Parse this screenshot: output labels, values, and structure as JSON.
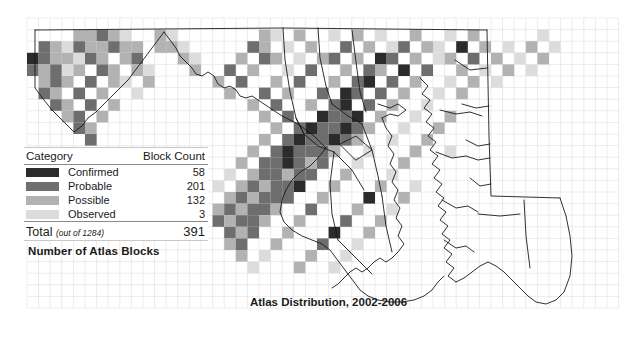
{
  "title": "Atlas Distribution, 2002-2006",
  "blocks_caption": "Number of Atlas Blocks",
  "legend": {
    "header": {
      "category": "Category",
      "count": "Block Count"
    },
    "rows": [
      {
        "label": "Confirmed",
        "count": "58",
        "color": "#2b2b2b"
      },
      {
        "label": "Probable",
        "count": "201",
        "color": "#6e6e6e"
      },
      {
        "label": "Possible",
        "count": "132",
        "color": "#b2b2b2"
      },
      {
        "label": "Observed",
        "count": "3",
        "color": "#dcdcdc"
      }
    ],
    "total": {
      "label": "Total",
      "note": "(out of 1284)",
      "count": "391"
    }
  },
  "map": {
    "grid_size": 11.6,
    "grid_origin_x": 27,
    "grid_origin_y": 18,
    "grid_line_color": "#d9d9d9",
    "outline_color": "#1a1a1a",
    "cells": [
      [
        4,
        1,
        "#b2b2b2"
      ],
      [
        5,
        1,
        "#b2b2b2"
      ],
      [
        6,
        1,
        "#6e6e6e"
      ],
      [
        7,
        1,
        "#b2b2b2"
      ],
      [
        8,
        1,
        "#dcdcdc"
      ],
      [
        11,
        1,
        "#b2b2b2"
      ],
      [
        12,
        1,
        "#dcdcdc"
      ],
      [
        20,
        1,
        "#b2b2b2"
      ],
      [
        21,
        1,
        "#dcdcdc"
      ],
      [
        23,
        1,
        "#b2b2b2"
      ],
      [
        26,
        1,
        "#dcdcdc"
      ],
      [
        28,
        1,
        "#b2b2b2"
      ],
      [
        30,
        1,
        "#dcdcdc"
      ],
      [
        33,
        1,
        "#b2b2b2"
      ],
      [
        36,
        1,
        "#dcdcdc"
      ],
      [
        38,
        1,
        "#b2b2b2"
      ],
      [
        44,
        1,
        "#dcdcdc"
      ],
      [
        1,
        2,
        "#6e6e6e"
      ],
      [
        2,
        2,
        "#b2b2b2"
      ],
      [
        3,
        2,
        "#dcdcdc"
      ],
      [
        4,
        2,
        "#6e6e6e"
      ],
      [
        5,
        2,
        "#b2b2b2"
      ],
      [
        6,
        2,
        "#b2b2b2"
      ],
      [
        7,
        2,
        "#6e6e6e"
      ],
      [
        8,
        2,
        "#b2b2b2"
      ],
      [
        9,
        2,
        "#b2b2b2"
      ],
      [
        11,
        2,
        "#b2b2b2"
      ],
      [
        12,
        2,
        "#b2b2b2"
      ],
      [
        13,
        2,
        "#dcdcdc"
      ],
      [
        19,
        2,
        "#6e6e6e"
      ],
      [
        20,
        2,
        "#b2b2b2"
      ],
      [
        22,
        2,
        "#dcdcdc"
      ],
      [
        24,
        2,
        "#b2b2b2"
      ],
      [
        27,
        2,
        "#6e6e6e"
      ],
      [
        29,
        2,
        "#b2b2b2"
      ],
      [
        31,
        2,
        "#dcdcdc"
      ],
      [
        32,
        2,
        "#6e6e6e"
      ],
      [
        34,
        2,
        "#b2b2b2"
      ],
      [
        35,
        2,
        "#dcdcdc"
      ],
      [
        37,
        2,
        "#2b2b2b"
      ],
      [
        39,
        2,
        "#b2b2b2"
      ],
      [
        41,
        2,
        "#dcdcdc"
      ],
      [
        43,
        2,
        "#b2b2b2"
      ],
      [
        45,
        2,
        "#dcdcdc"
      ],
      [
        0,
        3,
        "#2b2b2b"
      ],
      [
        1,
        3,
        "#6e6e6e"
      ],
      [
        2,
        3,
        "#b2b2b2"
      ],
      [
        3,
        3,
        "#b2b2b2"
      ],
      [
        4,
        3,
        "#dcdcdc"
      ],
      [
        5,
        3,
        "#6e6e6e"
      ],
      [
        6,
        3,
        "#b2b2b2"
      ],
      [
        8,
        3,
        "#b2b2b2"
      ],
      [
        9,
        3,
        "#6e6e6e"
      ],
      [
        13,
        3,
        "#b2b2b2"
      ],
      [
        14,
        3,
        "#dcdcdc"
      ],
      [
        18,
        3,
        "#b2b2b2"
      ],
      [
        20,
        3,
        "#6e6e6e"
      ],
      [
        21,
        3,
        "#b2b2b2"
      ],
      [
        23,
        3,
        "#dcdcdc"
      ],
      [
        25,
        3,
        "#b2b2b2"
      ],
      [
        26,
        3,
        "#6e6e6e"
      ],
      [
        28,
        3,
        "#b2b2b2"
      ],
      [
        30,
        3,
        "#2b2b2b"
      ],
      [
        31,
        3,
        "#6e6e6e"
      ],
      [
        33,
        3,
        "#b2b2b2"
      ],
      [
        35,
        3,
        "#dcdcdc"
      ],
      [
        36,
        3,
        "#b2b2b2"
      ],
      [
        38,
        3,
        "#6e6e6e"
      ],
      [
        40,
        3,
        "#b2b2b2"
      ],
      [
        42,
        3,
        "#dcdcdc"
      ],
      [
        44,
        3,
        "#b2b2b2"
      ],
      [
        0,
        4,
        "#6e6e6e"
      ],
      [
        1,
        4,
        "#b2b2b2"
      ],
      [
        2,
        4,
        "#6e6e6e"
      ],
      [
        3,
        4,
        "#dcdcdc"
      ],
      [
        4,
        4,
        "#b2b2b2"
      ],
      [
        6,
        4,
        "#6e6e6e"
      ],
      [
        7,
        4,
        "#b2b2b2"
      ],
      [
        9,
        4,
        "#b2b2b2"
      ],
      [
        10,
        4,
        "#dcdcdc"
      ],
      [
        14,
        4,
        "#b2b2b2"
      ],
      [
        17,
        4,
        "#6e6e6e"
      ],
      [
        19,
        4,
        "#b2b2b2"
      ],
      [
        22,
        4,
        "#dcdcdc"
      ],
      [
        24,
        4,
        "#6e6e6e"
      ],
      [
        27,
        4,
        "#b2b2b2"
      ],
      [
        29,
        4,
        "#6e6e6e"
      ],
      [
        30,
        4,
        "#b2b2b2"
      ],
      [
        32,
        4,
        "#2b2b2b"
      ],
      [
        34,
        4,
        "#6e6e6e"
      ],
      [
        37,
        4,
        "#b2b2b2"
      ],
      [
        39,
        4,
        "#dcdcdc"
      ],
      [
        41,
        4,
        "#b2b2b2"
      ],
      [
        43,
        4,
        "#dcdcdc"
      ],
      [
        1,
        5,
        "#b2b2b2"
      ],
      [
        2,
        5,
        "#6e6e6e"
      ],
      [
        3,
        5,
        "#b2b2b2"
      ],
      [
        5,
        5,
        "#6e6e6e"
      ],
      [
        7,
        5,
        "#b2b2b2"
      ],
      [
        8,
        5,
        "#dcdcdc"
      ],
      [
        10,
        5,
        "#b2b2b2"
      ],
      [
        16,
        5,
        "#b2b2b2"
      ],
      [
        18,
        5,
        "#6e6e6e"
      ],
      [
        21,
        5,
        "#b2b2b2"
      ],
      [
        23,
        5,
        "#6e6e6e"
      ],
      [
        26,
        5,
        "#b2b2b2"
      ],
      [
        28,
        5,
        "#6e6e6e"
      ],
      [
        29,
        5,
        "#2b2b2b"
      ],
      [
        31,
        5,
        "#6e6e6e"
      ],
      [
        33,
        5,
        "#b2b2b2"
      ],
      [
        36,
        5,
        "#dcdcdc"
      ],
      [
        38,
        5,
        "#b2b2b2"
      ],
      [
        40,
        5,
        "#dcdcdc"
      ],
      [
        1,
        6,
        "#6e6e6e"
      ],
      [
        2,
        6,
        "#b2b2b2"
      ],
      [
        4,
        6,
        "#6e6e6e"
      ],
      [
        6,
        6,
        "#b2b2b2"
      ],
      [
        9,
        6,
        "#dcdcdc"
      ],
      [
        17,
        6,
        "#b2b2b2"
      ],
      [
        20,
        6,
        "#6e6e6e"
      ],
      [
        22,
        6,
        "#b2b2b2"
      ],
      [
        25,
        6,
        "#6e6e6e"
      ],
      [
        27,
        6,
        "#2b2b2b"
      ],
      [
        28,
        6,
        "#6e6e6e"
      ],
      [
        30,
        6,
        "#6e6e6e"
      ],
      [
        32,
        6,
        "#b2b2b2"
      ],
      [
        35,
        6,
        "#dcdcdc"
      ],
      [
        37,
        6,
        "#b2b2b2"
      ],
      [
        2,
        7,
        "#6e6e6e"
      ],
      [
        3,
        7,
        "#b2b2b2"
      ],
      [
        5,
        7,
        "#6e6e6e"
      ],
      [
        7,
        7,
        "#b2b2b2"
      ],
      [
        19,
        7,
        "#b2b2b2"
      ],
      [
        21,
        7,
        "#6e6e6e"
      ],
      [
        24,
        7,
        "#b2b2b2"
      ],
      [
        26,
        7,
        "#6e6e6e"
      ],
      [
        27,
        7,
        "#2b2b2b"
      ],
      [
        29,
        7,
        "#6e6e6e"
      ],
      [
        31,
        7,
        "#b2b2b2"
      ],
      [
        34,
        7,
        "#dcdcdc"
      ],
      [
        3,
        8,
        "#b2b2b2"
      ],
      [
        4,
        8,
        "#6e6e6e"
      ],
      [
        6,
        8,
        "#b2b2b2"
      ],
      [
        20,
        8,
        "#b2b2b2"
      ],
      [
        22,
        8,
        "#6e6e6e"
      ],
      [
        25,
        8,
        "#2b2b2b"
      ],
      [
        26,
        8,
        "#6e6e6e"
      ],
      [
        27,
        8,
        "#6e6e6e"
      ],
      [
        28,
        8,
        "#2b2b2b"
      ],
      [
        30,
        8,
        "#b2b2b2"
      ],
      [
        33,
        8,
        "#dcdcdc"
      ],
      [
        36,
        8,
        "#b2b2b2"
      ],
      [
        4,
        9,
        "#6e6e6e"
      ],
      [
        5,
        9,
        "#b2b2b2"
      ],
      [
        21,
        9,
        "#b2b2b2"
      ],
      [
        23,
        9,
        "#6e6e6e"
      ],
      [
        24,
        9,
        "#2b2b2b"
      ],
      [
        25,
        9,
        "#6e6e6e"
      ],
      [
        26,
        9,
        "#6e6e6e"
      ],
      [
        27,
        9,
        "#2b2b2b"
      ],
      [
        28,
        9,
        "#6e6e6e"
      ],
      [
        29,
        9,
        "#b2b2b2"
      ],
      [
        32,
        9,
        "#dcdcdc"
      ],
      [
        35,
        9,
        "#b2b2b2"
      ],
      [
        5,
        10,
        "#6e6e6e"
      ],
      [
        20,
        10,
        "#b2b2b2"
      ],
      [
        22,
        10,
        "#6e6e6e"
      ],
      [
        23,
        10,
        "#2b2b2b"
      ],
      [
        24,
        10,
        "#6e6e6e"
      ],
      [
        25,
        10,
        "#6e6e6e"
      ],
      [
        26,
        10,
        "#2b2b2b"
      ],
      [
        27,
        10,
        "#6e6e6e"
      ],
      [
        28,
        10,
        "#b2b2b2"
      ],
      [
        31,
        10,
        "#dcdcdc"
      ],
      [
        34,
        10,
        "#b2b2b2"
      ],
      [
        19,
        11,
        "#b2b2b2"
      ],
      [
        21,
        11,
        "#6e6e6e"
      ],
      [
        22,
        11,
        "#2b2b2b"
      ],
      [
        23,
        11,
        "#6e6e6e"
      ],
      [
        24,
        11,
        "#6e6e6e"
      ],
      [
        25,
        11,
        "#6e6e6e"
      ],
      [
        26,
        11,
        "#b2b2b2"
      ],
      [
        29,
        11,
        "#dcdcdc"
      ],
      [
        33,
        11,
        "#b2b2b2"
      ],
      [
        36,
        11,
        "#dcdcdc"
      ],
      [
        18,
        12,
        "#b2b2b2"
      ],
      [
        20,
        12,
        "#6e6e6e"
      ],
      [
        21,
        12,
        "#6e6e6e"
      ],
      [
        22,
        12,
        "#2b2b2b"
      ],
      [
        23,
        12,
        "#6e6e6e"
      ],
      [
        24,
        12,
        "#b2b2b2"
      ],
      [
        25,
        12,
        "#6e6e6e"
      ],
      [
        28,
        12,
        "#dcdcdc"
      ],
      [
        32,
        12,
        "#b2b2b2"
      ],
      [
        17,
        13,
        "#dcdcdc"
      ],
      [
        19,
        13,
        "#b2b2b2"
      ],
      [
        20,
        13,
        "#6e6e6e"
      ],
      [
        21,
        13,
        "#6e6e6e"
      ],
      [
        22,
        13,
        "#b2b2b2"
      ],
      [
        23,
        13,
        "#6e6e6e"
      ],
      [
        24,
        13,
        "#6e6e6e"
      ],
      [
        27,
        13,
        "#b2b2b2"
      ],
      [
        31,
        13,
        "#dcdcdc"
      ],
      [
        16,
        14,
        "#dcdcdc"
      ],
      [
        18,
        14,
        "#b2b2b2"
      ],
      [
        19,
        14,
        "#6e6e6e"
      ],
      [
        20,
        14,
        "#b2b2b2"
      ],
      [
        21,
        14,
        "#6e6e6e"
      ],
      [
        22,
        14,
        "#6e6e6e"
      ],
      [
        23,
        14,
        "#2b2b2b"
      ],
      [
        26,
        14,
        "#b2b2b2"
      ],
      [
        30,
        14,
        "#b2b2b2"
      ],
      [
        33,
        14,
        "#dcdcdc"
      ],
      [
        17,
        15,
        "#b2b2b2"
      ],
      [
        18,
        15,
        "#6e6e6e"
      ],
      [
        19,
        15,
        "#b2b2b2"
      ],
      [
        20,
        15,
        "#6e6e6e"
      ],
      [
        21,
        15,
        "#6e6e6e"
      ],
      [
        22,
        15,
        "#6e6e6e"
      ],
      [
        25,
        15,
        "#b2b2b2"
      ],
      [
        29,
        15,
        "#2b2b2b"
      ],
      [
        32,
        15,
        "#b2b2b2"
      ],
      [
        16,
        16,
        "#b2b2b2"
      ],
      [
        17,
        16,
        "#6e6e6e"
      ],
      [
        18,
        16,
        "#b2b2b2"
      ],
      [
        19,
        16,
        "#6e6e6e"
      ],
      [
        20,
        16,
        "#6e6e6e"
      ],
      [
        21,
        16,
        "#b2b2b2"
      ],
      [
        24,
        16,
        "#6e6e6e"
      ],
      [
        28,
        16,
        "#b2b2b2"
      ],
      [
        31,
        16,
        "#dcdcdc"
      ],
      [
        16,
        17,
        "#6e6e6e"
      ],
      [
        17,
        17,
        "#b2b2b2"
      ],
      [
        18,
        17,
        "#6e6e6e"
      ],
      [
        19,
        17,
        "#6e6e6e"
      ],
      [
        20,
        17,
        "#b2b2b2"
      ],
      [
        23,
        17,
        "#b2b2b2"
      ],
      [
        27,
        17,
        "#6e6e6e"
      ],
      [
        30,
        17,
        "#b2b2b2"
      ],
      [
        17,
        18,
        "#6e6e6e"
      ],
      [
        18,
        18,
        "#b2b2b2"
      ],
      [
        19,
        18,
        "#6e6e6e"
      ],
      [
        22,
        18,
        "#b2b2b2"
      ],
      [
        26,
        18,
        "#2b2b2b"
      ],
      [
        29,
        18,
        "#b2b2b2"
      ],
      [
        17,
        19,
        "#b2b2b2"
      ],
      [
        18,
        19,
        "#6e6e6e"
      ],
      [
        21,
        19,
        "#b2b2b2"
      ],
      [
        25,
        19,
        "#6e6e6e"
      ],
      [
        28,
        19,
        "#dcdcdc"
      ],
      [
        18,
        20,
        "#b2b2b2"
      ],
      [
        20,
        20,
        "#dcdcdc"
      ],
      [
        24,
        20,
        "#b2b2b2"
      ],
      [
        27,
        20,
        "#dcdcdc"
      ],
      [
        19,
        21,
        "#dcdcdc"
      ],
      [
        23,
        21,
        "#b2b2b2"
      ],
      [
        26,
        21,
        "#dcdcdc"
      ]
    ]
  }
}
